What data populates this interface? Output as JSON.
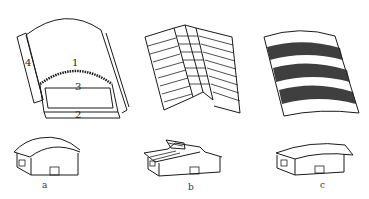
{
  "figure": {
    "type": "technical line drawing",
    "panels": [
      {
        "id": "a",
        "caption": "a",
        "description": "Arched roof with skylight",
        "part_labels": [
          "1",
          "2",
          "3",
          "4"
        ]
      },
      {
        "id": "b",
        "caption": "b",
        "description": "Sawtooth/folded plate roof"
      },
      {
        "id": "c",
        "caption": "c",
        "description": "Curved roof with dark stripe bands"
      }
    ],
    "colors": {
      "line": "#1a1a1a",
      "background": "#ffffff",
      "band": "#2a2a2a"
    }
  }
}
